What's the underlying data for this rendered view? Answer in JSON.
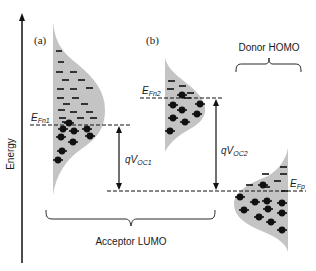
{
  "diagram": {
    "axis": {
      "label": "Energy"
    },
    "panels": [
      {
        "id": "a",
        "label": "(a)"
      },
      {
        "id": "b",
        "label": "(b)"
      }
    ],
    "fermi_levels": [
      {
        "id": "EFn1",
        "base": "E",
        "sub": "Fn1"
      },
      {
        "id": "EFn2",
        "base": "E",
        "sub": "Fn2"
      },
      {
        "id": "EFp",
        "base": "E",
        "sub": "Fp"
      }
    ],
    "voltages": [
      {
        "id": "qVOC1",
        "base": "qV",
        "sub": "OC1"
      },
      {
        "id": "qVOC2",
        "base": "qV",
        "sub": "OC2"
      }
    ],
    "groups": {
      "acceptor": "Acceptor LUMO",
      "donor": "Donor HOMO"
    },
    "colors": {
      "dos_fill": "#c4c4c4",
      "line": "#111111"
    }
  }
}
